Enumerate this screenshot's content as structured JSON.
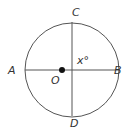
{
  "diagram": {
    "type": "circle-geometry",
    "circle": {
      "center": [
        72,
        70
      ],
      "radius": 47,
      "stroke": "#555555"
    },
    "center_dot": {
      "position": [
        62,
        70
      ],
      "color": "#111111"
    },
    "lines": [
      {
        "name": "segment-AB",
        "from": "A",
        "to": "B"
      },
      {
        "name": "chord-CD",
        "from": "C",
        "to": "D"
      }
    ],
    "labels": {
      "A": "A",
      "B": "B",
      "C": "C",
      "D": "D",
      "O": "O",
      "angle": "x°"
    }
  }
}
